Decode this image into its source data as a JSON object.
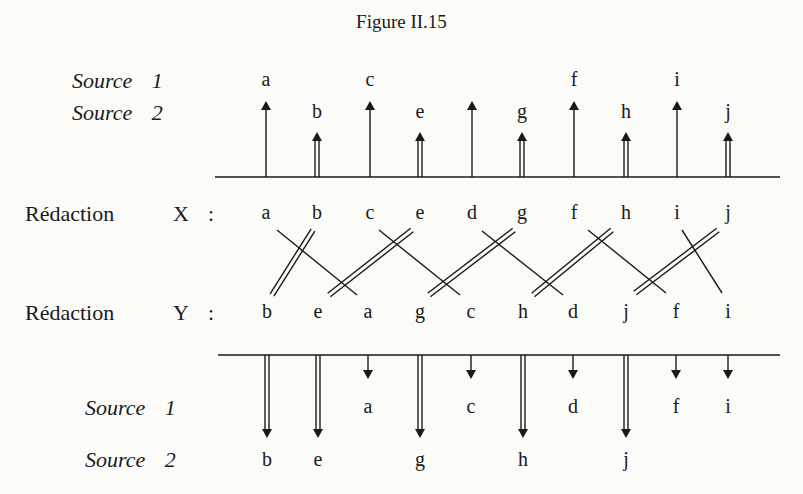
{
  "title": "Figure II.15",
  "top": {
    "source1_label": "Source",
    "source1_num": "1",
    "source2_label": "Source",
    "source2_num": "2",
    "axis_y": 177,
    "columns": [
      {
        "x": 266,
        "source": 1,
        "label": "a"
      },
      {
        "x": 317,
        "source": 2,
        "label": "b"
      },
      {
        "x": 370,
        "source": 1,
        "label": "c"
      },
      {
        "x": 420,
        "source": 2,
        "label": "e"
      },
      {
        "x": 472,
        "source": 1,
        "label": ""
      },
      {
        "x": 522,
        "source": 2,
        "label": "g"
      },
      {
        "x": 574,
        "source": 1,
        "label": "f"
      },
      {
        "x": 626,
        "source": 2,
        "label": "h"
      },
      {
        "x": 677,
        "source": 1,
        "label": "i"
      },
      {
        "x": 728,
        "source": 2,
        "label": "j"
      }
    ]
  },
  "redaction_x": {
    "label": "Rédaction",
    "key": "X",
    "colon": ":",
    "sequence": [
      "a",
      "b",
      "c",
      "e",
      "d",
      "g",
      "f",
      "h",
      "i",
      "j"
    ]
  },
  "redaction_y": {
    "label": "Rédaction",
    "key": "Y",
    "colon": ":",
    "sequence": [
      "b",
      "e",
      "a",
      "g",
      "c",
      "h",
      "d",
      "j",
      "f",
      "i"
    ]
  },
  "links": [
    {
      "item": "a",
      "type": "single",
      "x1": 277,
      "y1": 230,
      "x2": 357,
      "y2": 295
    },
    {
      "item": "b",
      "type": "double",
      "x1": 313,
      "y1": 230,
      "x2": 272,
      "y2": 295
    },
    {
      "item": "c",
      "type": "single",
      "x1": 379,
      "y1": 230,
      "x2": 460,
      "y2": 295
    },
    {
      "item": "e",
      "type": "double",
      "x1": 412,
      "y1": 230,
      "x2": 329,
      "y2": 295
    },
    {
      "item": "d",
      "type": "single",
      "x1": 482,
      "y1": 231,
      "x2": 563,
      "y2": 295
    },
    {
      "item": "g",
      "type": "double",
      "x1": 514,
      "y1": 230,
      "x2": 429,
      "y2": 295
    },
    {
      "item": "f",
      "type": "single",
      "x1": 588,
      "y1": 230,
      "x2": 666,
      "y2": 293
    },
    {
      "item": "h",
      "type": "double",
      "x1": 612,
      "y1": 230,
      "x2": 533,
      "y2": 295
    },
    {
      "item": "i",
      "type": "single",
      "x1": 682,
      "y1": 230,
      "x2": 722,
      "y2": 293
    },
    {
      "item": "j",
      "type": "double",
      "x1": 718,
      "y1": 230,
      "x2": 635,
      "y2": 293
    }
  ],
  "bottom": {
    "source1_label": "Source",
    "source1_num": "1",
    "source2_label": "Source",
    "source2_num": "2",
    "axis_y": 355,
    "columns": [
      {
        "x": 267,
        "source": 2,
        "label": "b"
      },
      {
        "x": 318,
        "source": 2,
        "label": "e"
      },
      {
        "x": 368,
        "source": 1,
        "label": "a"
      },
      {
        "x": 420,
        "source": 2,
        "label": "g"
      },
      {
        "x": 471,
        "source": 1,
        "label": "c"
      },
      {
        "x": 523,
        "source": 2,
        "label": "h"
      },
      {
        "x": 573,
        "source": 1,
        "label": "d"
      },
      {
        "x": 626,
        "source": 2,
        "label": "j"
      },
      {
        "x": 676,
        "source": 1,
        "label": "f"
      },
      {
        "x": 728,
        "source": 1,
        "label": "i"
      }
    ]
  },
  "colors": {
    "ink": "#1a1a1a",
    "paper": "#fbfbf8"
  }
}
